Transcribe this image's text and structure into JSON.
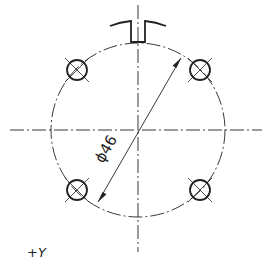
{
  "drawing": {
    "type": "bolt circle / flange drawing",
    "dimension_label": "ϕ46",
    "axis_label": "+Y",
    "hole_count": 4,
    "colors": {
      "line": "#222222",
      "background": "#ffffff"
    }
  }
}
